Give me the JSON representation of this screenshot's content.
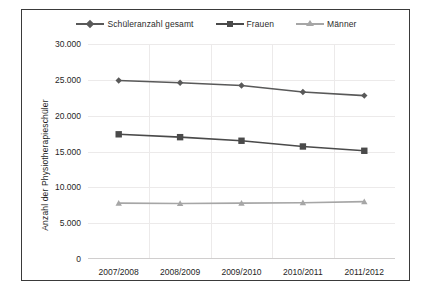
{
  "chart_data": {
    "type": "line",
    "title": "",
    "xlabel": "",
    "ylabel": "Anzahl der Physiotherapieschüler",
    "categories": [
      "2007/2008",
      "2008/2009",
      "2009/2010",
      "2010/2011",
      "2011/2012"
    ],
    "ylim": [
      0,
      30000
    ],
    "ytick_labels": [
      "30.000",
      "25.000",
      "20.000",
      "15.000",
      "10.000",
      "5.000",
      "0"
    ],
    "ytick_values": [
      30000,
      25000,
      20000,
      15000,
      10000,
      5000,
      0
    ],
    "grid": true,
    "legend_position": "top",
    "series": [
      {
        "name": "Schüleranzahl gesamt",
        "marker": "diamond",
        "color": "#595959",
        "values": [
          24900,
          24600,
          24200,
          23300,
          22800
        ]
      },
      {
        "name": "Frauen",
        "marker": "square",
        "color": "#4a4a4a",
        "values": [
          17400,
          17000,
          16500,
          15700,
          15100
        ]
      },
      {
        "name": "Männer",
        "marker": "triangle",
        "color": "#a6a6a6",
        "values": [
          7800,
          7750,
          7800,
          7850,
          8000
        ]
      }
    ]
  },
  "colors": {
    "frame": "#3a3a3a",
    "grid": "#eceaea",
    "text": "#1f1f1f",
    "background": "#ffffff"
  }
}
